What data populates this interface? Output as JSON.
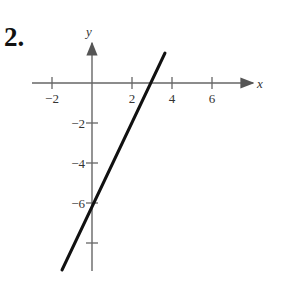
{
  "problem_number": "2.",
  "chart_data": {
    "type": "line",
    "title": "",
    "xlabel": "x",
    "ylabel": "y",
    "xlim": [
      -3,
      8
    ],
    "ylim": [
      -9.5,
      2
    ],
    "x_ticks": [
      -2,
      2,
      4,
      6
    ],
    "x_tick_labels": [
      "−2",
      "2",
      "4",
      "6"
    ],
    "y_ticks": [
      -2,
      -4,
      -6,
      -8
    ],
    "y_tick_labels": [
      "−2",
      "−4",
      "−6",
      ""
    ],
    "grid": false,
    "series": [
      {
        "name": "line",
        "equation": "y = 2x - 6",
        "x": [
          -1.5,
          3.65
        ],
        "y": [
          -9.35,
          1.5
        ]
      }
    ],
    "x_intercept": 3,
    "y_intercept": -6
  }
}
